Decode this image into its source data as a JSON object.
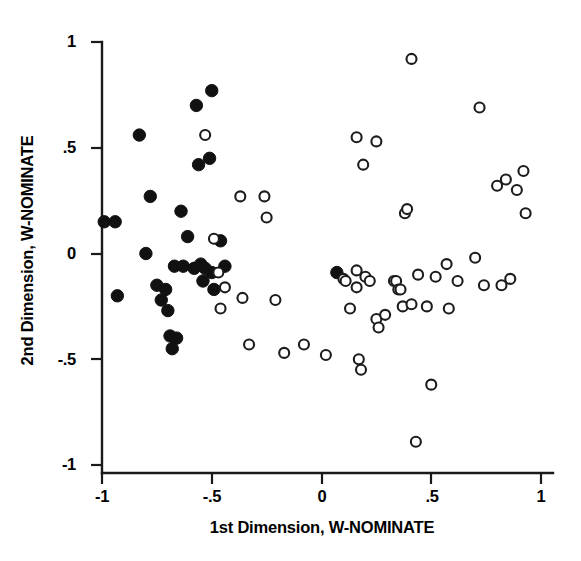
{
  "chart_data": {
    "type": "scatter",
    "title": "",
    "xlabel": "1st Dimension, W-NOMINATE",
    "ylabel": "2nd Dimension, W-NOMINATE",
    "xlim": [
      -1,
      1
    ],
    "ylim": [
      -1,
      1
    ],
    "xticks": [
      -1,
      -0.5,
      0,
      0.5,
      1
    ],
    "yticks": [
      -1,
      -0.5,
      0,
      0.5,
      1
    ],
    "xtick_labels": [
      "-1",
      "-.5",
      "0",
      ".5",
      "1"
    ],
    "ytick_labels": [
      "-1",
      "-.5",
      "0",
      ".5",
      "1"
    ],
    "grid": false,
    "legend": "none",
    "series": [
      {
        "name": "filled-markers",
        "marker": "filled-circle",
        "color": "#111111",
        "points": [
          [
            -0.99,
            0.15
          ],
          [
            -0.94,
            0.15
          ],
          [
            -0.93,
            -0.2
          ],
          [
            -0.83,
            0.56
          ],
          [
            -0.8,
            0.0
          ],
          [
            -0.78,
            0.27
          ],
          [
            -0.75,
            -0.15
          ],
          [
            -0.73,
            -0.22
          ],
          [
            -0.71,
            -0.17
          ],
          [
            -0.7,
            -0.27
          ],
          [
            -0.69,
            -0.39
          ],
          [
            -0.68,
            -0.45
          ],
          [
            -0.67,
            -0.06
          ],
          [
            -0.66,
            -0.4
          ],
          [
            -0.64,
            0.2
          ],
          [
            -0.63,
            -0.06
          ],
          [
            -0.61,
            0.08
          ],
          [
            -0.58,
            -0.07
          ],
          [
            -0.57,
            0.7
          ],
          [
            -0.56,
            0.42
          ],
          [
            -0.55,
            -0.05
          ],
          [
            -0.54,
            -0.13
          ],
          [
            -0.53,
            -0.07
          ],
          [
            -0.51,
            0.45
          ],
          [
            -0.5,
            0.77
          ],
          [
            -0.5,
            -0.09
          ],
          [
            -0.49,
            -0.17
          ],
          [
            -0.46,
            0.06
          ],
          [
            -0.44,
            -0.06
          ],
          [
            0.07,
            -0.09
          ]
        ]
      },
      {
        "name": "open-markers",
        "marker": "open-circle",
        "color": "#ffffff",
        "points": [
          [
            -0.53,
            0.56
          ],
          [
            -0.49,
            0.07
          ],
          [
            -0.47,
            -0.09
          ],
          [
            -0.46,
            -0.26
          ],
          [
            -0.44,
            -0.16
          ],
          [
            -0.37,
            0.27
          ],
          [
            -0.36,
            -0.21
          ],
          [
            -0.33,
            -0.43
          ],
          [
            -0.26,
            0.27
          ],
          [
            -0.25,
            0.17
          ],
          [
            -0.21,
            -0.22
          ],
          [
            -0.17,
            -0.47
          ],
          [
            -0.08,
            -0.43
          ],
          [
            0.02,
            -0.48
          ],
          [
            0.1,
            -0.12
          ],
          [
            0.11,
            -0.13
          ],
          [
            0.13,
            -0.26
          ],
          [
            0.16,
            0.55
          ],
          [
            0.16,
            -0.08
          ],
          [
            0.16,
            -0.16
          ],
          [
            0.17,
            -0.5
          ],
          [
            0.18,
            -0.55
          ],
          [
            0.19,
            0.42
          ],
          [
            0.2,
            -0.11
          ],
          [
            0.22,
            -0.13
          ],
          [
            0.25,
            0.53
          ],
          [
            0.25,
            -0.31
          ],
          [
            0.26,
            -0.35
          ],
          [
            0.29,
            -0.29
          ],
          [
            0.33,
            -0.13
          ],
          [
            0.34,
            -0.13
          ],
          [
            0.35,
            -0.17
          ],
          [
            0.36,
            -0.17
          ],
          [
            0.37,
            -0.25
          ],
          [
            0.38,
            0.19
          ],
          [
            0.39,
            0.21
          ],
          [
            0.41,
            0.92
          ],
          [
            0.41,
            -0.24
          ],
          [
            0.43,
            -0.89
          ],
          [
            0.44,
            -0.1
          ],
          [
            0.48,
            -0.25
          ],
          [
            0.5,
            -0.62
          ],
          [
            0.52,
            -0.11
          ],
          [
            0.57,
            -0.05
          ],
          [
            0.58,
            -0.26
          ],
          [
            0.62,
            -0.13
          ],
          [
            0.7,
            -0.02
          ],
          [
            0.72,
            0.69
          ],
          [
            0.74,
            -0.15
          ],
          [
            0.8,
            0.32
          ],
          [
            0.82,
            -0.15
          ],
          [
            0.84,
            0.35
          ],
          [
            0.86,
            -0.12
          ],
          [
            0.89,
            0.3
          ],
          [
            0.92,
            0.39
          ],
          [
            0.93,
            0.19
          ]
        ]
      }
    ]
  },
  "axes": {
    "x_axis_label": "1st Dimension, W-NOMINATE",
    "y_axis_label": "2nd Dimension, W-NOMINATE"
  }
}
